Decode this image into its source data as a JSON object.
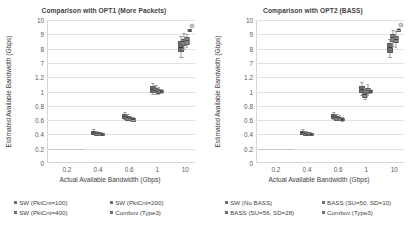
{
  "charts": [
    {
      "title": "Comparison with OPT1 (More Packets)",
      "ylabel": "Estimated Available Bandwidth (Gbps)",
      "xlabel": "Actual Available Bandwidth (Gbps)",
      "yticks": [
        "0",
        "0.2",
        "0.4",
        "0.6",
        "0.8",
        "1",
        "1.2",
        "7",
        "8",
        "9",
        "10"
      ],
      "xticks": [
        "0.2",
        "0.4",
        "0.6",
        "1",
        "10"
      ],
      "legend": [
        "SW (PktCnt=100)",
        "SW (PktCnt=200)",
        "SW (PktCnt=400)",
        "Combov (Type3)"
      ]
    },
    {
      "title": "Comparison with OPT2 (BASS)",
      "ylabel": "Estimated Available Bandwidth (Gbps)",
      "xlabel": "Actual Available Bandwidth (Gbps)",
      "yticks": [
        "0",
        "0.2",
        "0.4",
        "0.6",
        "0.8",
        "1",
        "1.2",
        "7",
        "8",
        "9",
        "10"
      ],
      "xticks": [
        "0.2",
        "0.4",
        "0.6",
        "1",
        "10"
      ],
      "legend": [
        "SW (No BASS)",
        "BASS (SU=50, SD=10)",
        "BASS (SU=56, SD=28)",
        "Combov (Type3)"
      ]
    }
  ],
  "chart_data": [
    {
      "type": "box",
      "title": "Comparison with OPT1 (More Packets)",
      "xlabel": "Actual Available Bandwidth (Gbps)",
      "ylabel": "Estimated Available Bandwidth (Gbps)",
      "grid": true,
      "legend_position": "below",
      "axis_note": "y-axis is broken: lower segment 0-1.2 (ticks every 0.2), upper segment 7-10 (ticks every 1); x-axis is log-like with labelled ticks 0.2, 0.4, 0.6, 1, 10",
      "xtick_labels": [
        "0.2",
        "0.4",
        "0.6",
        "1",
        "10"
      ],
      "ytick_labels": [
        "0",
        "0.2",
        "0.4",
        "0.6",
        "0.8",
        "1",
        "1.2",
        "7",
        "8",
        "9",
        "10"
      ],
      "series": [
        "SW (PktCnt=100)",
        "SW (PktCnt=200)",
        "SW (PktCnt=400)",
        "Combov (Type3)"
      ],
      "groups": [
        {
          "actual_bandwidth": 0.4,
          "boxes": [
            {
              "series": "SW (PktCnt=100)",
              "min": 0.4,
              "q1": 0.42,
              "median": 0.43,
              "q3": 0.45,
              "max": 0.47
            },
            {
              "series": "SW (PktCnt=200)",
              "min": 0.4,
              "q1": 0.41,
              "median": 0.42,
              "q3": 0.43,
              "max": 0.45
            },
            {
              "series": "SW (PktCnt=400)",
              "min": 0.4,
              "q1": 0.41,
              "median": 0.42,
              "q3": 0.43,
              "max": 0.44
            },
            {
              "series": "Combov (Type3)",
              "min": 0.39,
              "q1": 0.4,
              "median": 0.41,
              "q3": 0.42,
              "max": 0.43
            }
          ]
        },
        {
          "actual_bandwidth": 0.6,
          "boxes": [
            {
              "series": "SW (PktCnt=100)",
              "min": 0.61,
              "q1": 0.64,
              "median": 0.66,
              "q3": 0.68,
              "max": 0.71
            },
            {
              "series": "SW (PktCnt=200)",
              "min": 0.6,
              "q1": 0.62,
              "median": 0.64,
              "q3": 0.66,
              "max": 0.68
            },
            {
              "series": "SW (PktCnt=400)",
              "min": 0.6,
              "q1": 0.61,
              "median": 0.63,
              "q3": 0.64,
              "max": 0.66
            },
            {
              "series": "Combov (Type3)",
              "min": 0.59,
              "q1": 0.6,
              "median": 0.62,
              "q3": 0.63,
              "max": 0.65
            }
          ]
        },
        {
          "actual_bandwidth": 1.0,
          "boxes": [
            {
              "series": "SW (PktCnt=100)",
              "min": 0.96,
              "q1": 1.0,
              "median": 1.03,
              "q3": 1.07,
              "max": 1.12
            },
            {
              "series": "SW (PktCnt=200)",
              "min": 0.97,
              "q1": 1.0,
              "median": 1.02,
              "q3": 1.05,
              "max": 1.09
            },
            {
              "series": "SW (PktCnt=400)",
              "min": 0.97,
              "q1": 0.99,
              "median": 1.01,
              "q3": 1.03,
              "max": 1.06
            },
            {
              "series": "Combov (Type3)",
              "min": 0.98,
              "q1": 1.0,
              "median": 1.01,
              "q3": 1.02,
              "max": 1.04
            }
          ]
        },
        {
          "actual_bandwidth": 10.0,
          "boxes": [
            {
              "series": "SW (PktCnt=100)",
              "min": 7.4,
              "q1": 7.9,
              "median": 8.1,
              "q3": 8.5,
              "max": 8.9
            },
            {
              "series": "SW (PktCnt=200)",
              "min": 8.0,
              "q1": 8.3,
              "median": 8.5,
              "q3": 8.7,
              "max": 9.1
            },
            {
              "series": "SW (PktCnt=400)",
              "min": 8.1,
              "q1": 8.4,
              "median": 8.6,
              "q3": 8.8,
              "max": 9.0
            },
            {
              "series": "Combov (Type3)",
              "min": 9.2,
              "q1": 9.3,
              "median": 9.3,
              "q3": 9.4,
              "max": 9.4
            }
          ]
        }
      ]
    },
    {
      "type": "box",
      "title": "Comparison with OPT2 (BASS)",
      "xlabel": "Actual Available Bandwidth (Gbps)",
      "ylabel": "Estimated Available Bandwidth (Gbps)",
      "grid": true,
      "legend_position": "below",
      "axis_note": "y-axis is broken: lower segment 0-1.2 (ticks every 0.2), upper segment 7-10 (ticks every 1); x-axis is log-like with labelled ticks 0.2, 0.4, 0.6, 1, 10",
      "xtick_labels": [
        "0.2",
        "0.4",
        "0.6",
        "1",
        "10"
      ],
      "ytick_labels": [
        "0",
        "0.2",
        "0.4",
        "0.6",
        "0.8",
        "1",
        "1.2",
        "7",
        "8",
        "9",
        "10"
      ],
      "series": [
        "SW (No BASS)",
        "BASS (SU=50, SD=10)",
        "BASS (SU=56, SD=28)",
        "Combov (Type3)"
      ],
      "groups": [
        {
          "actual_bandwidth": 0.4,
          "boxes": [
            {
              "series": "SW (No BASS)",
              "min": 0.4,
              "q1": 0.42,
              "median": 0.43,
              "q3": 0.45,
              "max": 0.47
            },
            {
              "series": "BASS (SU=50, SD=10)",
              "min": 0.39,
              "q1": 0.41,
              "median": 0.42,
              "q3": 0.43,
              "max": 0.45
            },
            {
              "series": "BASS (SU=56, SD=28)",
              "min": 0.39,
              "q1": 0.4,
              "median": 0.41,
              "q3": 0.43,
              "max": 0.44
            },
            {
              "series": "Combov (Type3)",
              "min": 0.39,
              "q1": 0.4,
              "median": 0.41,
              "q3": 0.42,
              "max": 0.43
            }
          ]
        },
        {
          "actual_bandwidth": 0.6,
          "boxes": [
            {
              "series": "SW (No BASS)",
              "min": 0.61,
              "q1": 0.64,
              "median": 0.66,
              "q3": 0.69,
              "max": 0.72
            },
            {
              "series": "BASS (SU=50, SD=10)",
              "min": 0.6,
              "q1": 0.62,
              "median": 0.64,
              "q3": 0.66,
              "max": 0.69
            },
            {
              "series": "BASS (SU=56, SD=28)",
              "min": 0.6,
              "q1": 0.61,
              "median": 0.63,
              "q3": 0.65,
              "max": 0.67
            },
            {
              "series": "Combov (Type3)",
              "min": 0.59,
              "q1": 0.61,
              "median": 0.62,
              "q3": 0.63,
              "max": 0.65
            }
          ]
        },
        {
          "actual_bandwidth": 1.0,
          "boxes": [
            {
              "series": "SW (No BASS)",
              "min": 0.95,
              "q1": 1.0,
              "median": 1.04,
              "q3": 1.08,
              "max": 1.13
            },
            {
              "series": "BASS (SU=50, SD=10)",
              "min": 0.9,
              "q1": 0.94,
              "median": 0.97,
              "q3": 1.0,
              "max": 1.05
            },
            {
              "series": "BASS (SU=56, SD=28)",
              "min": 0.95,
              "q1": 0.99,
              "median": 1.02,
              "q3": 1.05,
              "max": 1.1
            },
            {
              "series": "Combov (Type3)",
              "min": 0.98,
              "q1": 1.0,
              "median": 1.01,
              "q3": 1.02,
              "max": 1.04
            }
          ]
        },
        {
          "actual_bandwidth": 10.0,
          "boxes": [
            {
              "series": "SW (No BASS)",
              "min": 7.4,
              "q1": 7.8,
              "median": 8.1,
              "q3": 8.4,
              "max": 8.7
            },
            {
              "series": "BASS (SU=50, SD=10)",
              "min": 8.2,
              "q1": 8.6,
              "median": 8.8,
              "q3": 9.0,
              "max": 9.3
            },
            {
              "series": "BASS (SU=56, SD=28)",
              "min": 8.1,
              "q1": 8.5,
              "median": 8.7,
              "q3": 8.9,
              "max": 9.2
            },
            {
              "series": "Combov (Type3)",
              "min": 9.2,
              "q1": 9.3,
              "median": 9.35,
              "q3": 9.4,
              "max": 9.45
            }
          ]
        }
      ]
    }
  ]
}
